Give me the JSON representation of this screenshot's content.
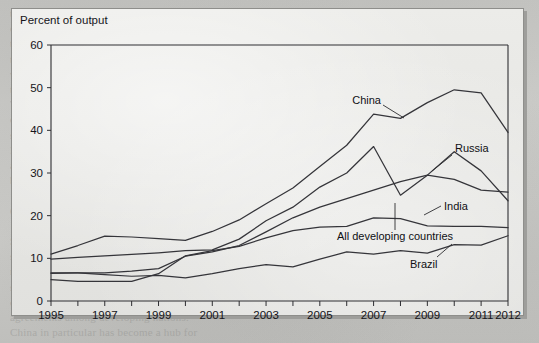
{
  "figure": {
    "axis_title": "Percent of output",
    "background_color": "#e9e9e6",
    "page_color": "#c9c9c6",
    "line_color": "#35353a"
  },
  "ghost_text": "the region. Both sides of the divide are\nchanging. Traditional export markets in\nthe advanced economies have been slow\nto recover from the global recession,\nwhile at the same time the dynamism of\nthe emerging markets has begun to fade.\nThe expansion of trade among the\ndeveloping economies is one of the most\nstriking features of the past two decades.\nIn 1995 developing countries sent about\na tenth of their exports to one another;\nby 2012 that share had risen sharply.\n\nOUR CHANGING WORLD\n\nSouth-South trade is rising fast and the\nshare of manufactures within it is also\nrising. A number of factors underpin this\nshift, including the rise of global value\nchains and the growth of regional trade\nagreements among developing nations.\nChina in particular has become a hub for\nregional production networks in Asia.\n\nTRADE WITH THE DEVELOPING WORLD\n\nRussia and Brazil show a different profile\nfrom that of China and India, reflecting a\ngreater reliance on commodity exports\nand a lower degree of integration into\nmanufacturing supply chains over time.",
  "chart_data": {
    "type": "line",
    "title": "",
    "ylabel": "Percent of output",
    "xlabel": "",
    "ylim": [
      0,
      60
    ],
    "ytick_values": [
      0,
      10,
      20,
      30,
      40,
      50,
      60
    ],
    "xlim": [
      1995,
      2012
    ],
    "x": [
      1995,
      1996,
      1997,
      1998,
      1999,
      2000,
      2001,
      2002,
      2003,
      2004,
      2005,
      2006,
      2007,
      2008,
      2009,
      2010,
      2011,
      2012
    ],
    "xtick_labels": [
      "1995",
      "1997",
      "1999",
      "2001",
      "2003",
      "2005",
      "2007",
      "2009",
      "2011",
      "2012"
    ],
    "xtick_values": [
      1995,
      1997,
      1999,
      2001,
      2003,
      2005,
      2007,
      2009,
      2011,
      2012
    ],
    "grid": false,
    "legend": "inline-annotations",
    "series": [
      {
        "name": "China",
        "label": "China",
        "values": [
          11.0,
          13.0,
          15.2,
          15.0,
          14.6,
          14.2,
          16.3,
          19.0,
          22.8,
          26.5,
          31.5,
          36.5,
          43.8,
          42.8,
          46.5,
          49.5,
          48.8,
          39.5
        ]
      },
      {
        "name": "Russia",
        "label": "Russia",
        "values": [
          9.8,
          10.2,
          10.6,
          10.9,
          11.3,
          11.8,
          12.0,
          14.5,
          18.8,
          22.0,
          26.7,
          30.0,
          36.2,
          24.8,
          29.5,
          35.0,
          30.5,
          23.5
        ]
      },
      {
        "name": "India",
        "label": "India",
        "values": [
          6.5,
          6.6,
          6.6,
          7.0,
          7.6,
          10.5,
          11.5,
          13.0,
          16.2,
          19.5,
          22.0,
          24.0,
          26.0,
          28.0,
          29.5,
          28.5,
          26.0,
          25.5
        ]
      },
      {
        "name": "All developing countries",
        "label": "All developing countries",
        "values": [
          5.0,
          4.6,
          4.6,
          4.6,
          6.4,
          10.6,
          11.8,
          12.8,
          14.8,
          16.5,
          17.3,
          17.5,
          19.5,
          19.3,
          17.6,
          17.5,
          17.5,
          17.2
        ]
      },
      {
        "name": "Brazil",
        "label": "Brazil",
        "values": [
          6.6,
          6.6,
          6.2,
          5.8,
          6.0,
          5.4,
          6.4,
          7.6,
          8.5,
          8.0,
          9.8,
          11.5,
          11.0,
          11.8,
          11.2,
          13.2,
          13.1,
          15.3
        ]
      }
    ],
    "annotations": [
      {
        "text": "China",
        "for": "China",
        "at_year": 2006.9,
        "at_value": 48.0
      },
      {
        "text": "Russia",
        "for": "Russia",
        "at_year": 2009.2,
        "at_value": 36.5
      },
      {
        "text": "India",
        "for": "India",
        "at_year": 2009.6,
        "at_value": 23.8
      },
      {
        "text": "All developing countries",
        "for": "All developing countries",
        "at_year": 2005.0,
        "at_value": 14.2
      },
      {
        "text": "Brazil",
        "for": "Brazil",
        "at_year": 2008.2,
        "at_value": 9.0
      }
    ]
  }
}
